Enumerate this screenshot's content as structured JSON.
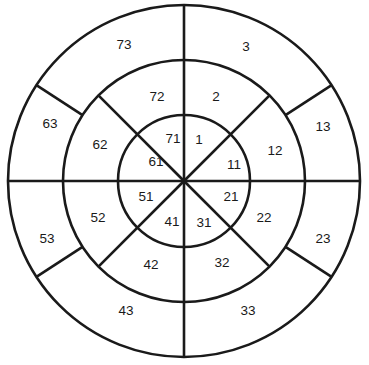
{
  "page": {
    "title_clipped": "",
    "background": "#ffffff",
    "stroke_color": "#1a1a1a",
    "label_color": "#1a1a1a"
  },
  "chart_data": {
    "type": "pie",
    "title": "",
    "subtitle": "",
    "xlabel": "",
    "ylabel": "",
    "legend": [],
    "grid": false,
    "center": {
      "cx": 184,
      "cy": 181
    },
    "radii": {
      "inner": 66,
      "middle": 121,
      "outer": 176
    },
    "sector_count": 8,
    "ring_count": 3,
    "sector_span_degrees": 45,
    "divider_angles_degrees": [
      0,
      45,
      90,
      135,
      180,
      225,
      270,
      315
    ],
    "rings": [
      {
        "name": "inner",
        "r_in": 0,
        "r_out": 66,
        "cells": [
          {
            "label": "1",
            "x": 199,
            "y": 140
          },
          {
            "label": "11",
            "x": 234,
            "y": 165
          },
          {
            "label": "21",
            "x": 231,
            "y": 197
          },
          {
            "label": "31",
            "x": 204,
            "y": 223
          },
          {
            "label": "41",
            "x": 172,
            "y": 222
          },
          {
            "label": "51",
            "x": 146,
            "y": 197
          },
          {
            "label": "61",
            "x": 156,
            "y": 162
          },
          {
            "label": "71",
            "x": 173,
            "y": 139
          }
        ]
      },
      {
        "name": "middle",
        "r_in": 66,
        "r_out": 121,
        "cells": [
          {
            "label": "2",
            "x": 216,
            "y": 97
          },
          {
            "label": "12",
            "x": 275,
            "y": 151
          },
          {
            "label": "22",
            "x": 264,
            "y": 218
          },
          {
            "label": "32",
            "x": 222,
            "y": 263
          },
          {
            "label": "42",
            "x": 151,
            "y": 265
          },
          {
            "label": "52",
            "x": 98,
            "y": 218
          },
          {
            "label": "62",
            "x": 100,
            "y": 145
          },
          {
            "label": "72",
            "x": 157,
            "y": 97
          }
        ]
      },
      {
        "name": "outer",
        "r_in": 121,
        "r_out": 176,
        "cells": [
          {
            "label": "3",
            "x": 246,
            "y": 47
          },
          {
            "label": "13",
            "x": 323,
            "y": 127
          },
          {
            "label": "23",
            "x": 323,
            "y": 239
          },
          {
            "label": "33",
            "x": 248,
            "y": 311
          },
          {
            "label": "43",
            "x": 126,
            "y": 311
          },
          {
            "label": "53",
            "x": 47,
            "y": 239
          },
          {
            "label": "63",
            "x": 50,
            "y": 124
          },
          {
            "label": "73",
            "x": 124,
            "y": 45
          }
        ]
      }
    ]
  }
}
